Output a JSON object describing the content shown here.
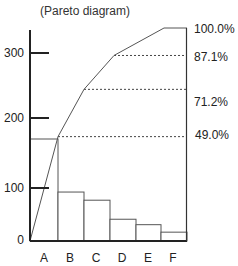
{
  "chart_data": {
    "type": "bar",
    "title": "(Pareto diagram)",
    "xlabel": "",
    "ylabel": "",
    "categories": [
      "A",
      "B",
      "C",
      "D",
      "E",
      "F"
    ],
    "series": [
      {
        "name": "count",
        "type": "bar",
        "values": [
          150,
          72,
          60,
          32,
          24,
          13
        ]
      },
      {
        "name": "cumulative %",
        "type": "line",
        "values": [
          49.0,
          71.2,
          87.1,
          null,
          100.0,
          100.0
        ]
      }
    ],
    "yticks": [
      0,
      100,
      200,
      300
    ],
    "ylim": [
      0,
      310
    ],
    "secondary_axis_labels": [
      "100.0%",
      "87.1%",
      "71.2%",
      "49.0%"
    ],
    "grid": false,
    "legend": "none"
  },
  "labels": {
    "title": "(Pareto diagram)",
    "yticks": [
      "300",
      "200",
      "100",
      "0"
    ],
    "xticks": [
      "A",
      "B",
      "C",
      "D",
      "E",
      "F"
    ],
    "pct": [
      "100.0%",
      "87.1%",
      "71.2%",
      "49.0%"
    ]
  }
}
